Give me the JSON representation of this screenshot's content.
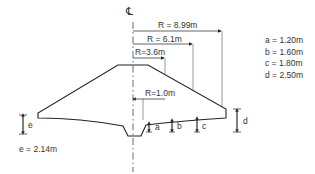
{
  "diagram": {
    "centerline_symbol": "℄",
    "radii": [
      {
        "id": "r899",
        "label": "R = 8.99m"
      },
      {
        "id": "r61",
        "label": "R = 6.1m"
      },
      {
        "id": "r36",
        "label": "R=3.6m"
      },
      {
        "id": "r10",
        "label": "R=1.0m"
      }
    ],
    "height_marks": [
      {
        "id": "a",
        "label": "a"
      },
      {
        "id": "b",
        "label": "b"
      },
      {
        "id": "c",
        "label": "c"
      },
      {
        "id": "d",
        "label": "d"
      },
      {
        "id": "e",
        "label": "e"
      }
    ],
    "legend": [
      {
        "label": "a = 1.20m"
      },
      {
        "label": "b = 1.60m"
      },
      {
        "label": "c = 1.80m"
      },
      {
        "label": "d = 2.50m"
      }
    ],
    "e_value": "e = 2.14m"
  }
}
